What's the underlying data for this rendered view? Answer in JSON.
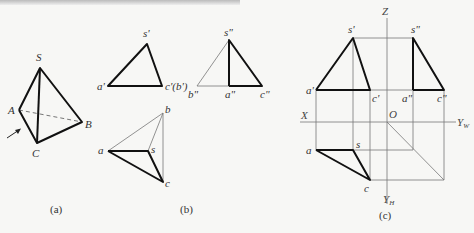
{
  "figure_a": {
    "caption": "(a)",
    "labels": {
      "S": "S",
      "A": "A",
      "B": "B",
      "C": "C"
    }
  },
  "figure_b": {
    "caption": "(b)",
    "front_view": {
      "s": "s'",
      "a": "a'",
      "c": "c'(b')"
    },
    "side_view": {
      "s": "s\"",
      "b": "b\"",
      "a": "a\"",
      "c": "c\""
    },
    "top_view": {
      "a": "a",
      "b": "b",
      "s": "s",
      "c": "c"
    }
  },
  "figure_c": {
    "caption": "(c)",
    "axes": {
      "Z": "Z",
      "X": "X",
      "O": "O",
      "YW": "Y",
      "YW_sub": "W",
      "YH": "Y",
      "YH_sub": "H"
    },
    "front_view": {
      "s": "s'",
      "a": "a'",
      "c": "c'"
    },
    "side_view": {
      "s": "s\"",
      "a": "a\"",
      "c": "c\""
    },
    "top_view": {
      "a": "a",
      "s": "s",
      "c": "c"
    }
  }
}
